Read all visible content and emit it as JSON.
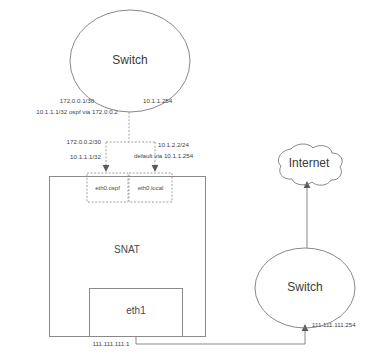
{
  "diagram": {
    "nodes": {
      "switch_top": {
        "label": "Switch"
      },
      "switch_bottom": {
        "label": "Switch"
      },
      "internet": {
        "label": "Internet"
      },
      "snat": {
        "label": "SNAT"
      },
      "eth1": {
        "label": "eth1"
      },
      "eth0_ospf": {
        "label": "eth0.ospf"
      },
      "eth0_local": {
        "label": "eth0.local"
      }
    },
    "labels": {
      "top_left_1": "172.0.0.1/30",
      "top_left_2": "10.1.1.1/32 ospf via 172.0.0.2",
      "top_right": "10.1.1.254",
      "mid_left_1": "172.0.0.2/30",
      "mid_left_2": "10.1.1.1/32",
      "mid_right_1": "10.1.2.2/24",
      "mid_right_2": "default via 10.1.1.254",
      "bottom_left": "111.111.111.1",
      "bottom_right": "111.111.111.254"
    },
    "colors": {
      "stroke": "#7b7b7b",
      "text": "#3a3a3a",
      "background": "#ffffff"
    }
  }
}
